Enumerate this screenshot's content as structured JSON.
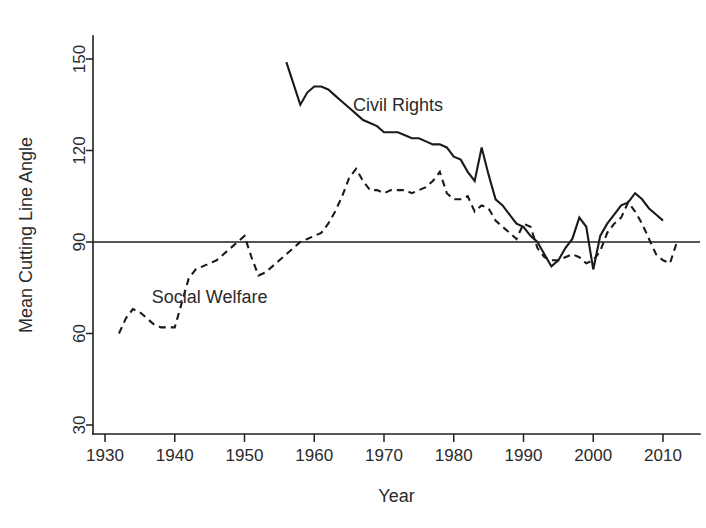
{
  "chart_data": {
    "type": "line",
    "title": "",
    "xlabel": "Year",
    "ylabel": "Mean Cutting Line Angle",
    "xlim": [
      1928,
      2014
    ],
    "ylim": [
      30,
      160
    ],
    "grid": false,
    "legend_position": "inline-annotation",
    "xticks": [
      1930,
      1940,
      1950,
      1960,
      1970,
      1980,
      1990,
      2000,
      2010
    ],
    "xtick_labels": [
      "1930",
      "1940",
      "1950",
      "1960",
      "1970",
      "1980",
      "1990",
      "2000",
      "2010"
    ],
    "yticks": [
      30,
      60,
      90,
      120,
      150
    ],
    "ytick_labels": [
      "30",
      "60",
      "90",
      "120",
      "150"
    ],
    "reference_line": {
      "value": 90,
      "label": "90",
      "style": "solid"
    },
    "series": [
      {
        "name": "Civil Rights",
        "style": "solid",
        "label_x": 1972,
        "label_y": 133,
        "x": [
          1956,
          1957,
          1958,
          1959,
          1960,
          1961,
          1962,
          1963,
          1964,
          1965,
          1966,
          1967,
          1968,
          1969,
          1970,
          1971,
          1972,
          1973,
          1974,
          1975,
          1976,
          1977,
          1978,
          1979,
          1980,
          1981,
          1982,
          1983,
          1984,
          1985,
          1986,
          1987,
          1988,
          1989,
          1990,
          1991,
          1992,
          1993,
          1994,
          1995,
          1996,
          1997,
          1998,
          1999,
          2000,
          2001,
          2002,
          2003,
          2004,
          2005,
          2006,
          2007,
          2008,
          2009,
          2010
        ],
        "y": [
          149,
          142,
          135,
          139,
          141,
          141,
          140,
          138,
          136,
          134,
          132,
          130,
          129,
          128,
          126,
          126,
          126,
          125,
          124,
          124,
          123,
          122,
          122,
          121,
          118,
          117,
          113,
          110,
          121,
          112,
          104,
          102,
          99,
          96,
          95,
          92,
          90,
          86,
          82,
          84,
          88,
          91,
          98,
          95,
          81,
          92,
          96,
          99,
          102,
          103,
          106,
          104,
          101,
          99,
          97
        ]
      },
      {
        "name": "Social Welfare",
        "style": "dashed",
        "label_x": 1945,
        "label_y": 70,
        "x": [
          1932,
          1933,
          1934,
          1935,
          1936,
          1937,
          1938,
          1939,
          1940,
          1941,
          1942,
          1943,
          1944,
          1945,
          1946,
          1947,
          1948,
          1949,
          1950,
          1951,
          1952,
          1953,
          1954,
          1955,
          1956,
          1957,
          1958,
          1959,
          1960,
          1961,
          1962,
          1963,
          1964,
          1965,
          1966,
          1967,
          1968,
          1969,
          1970,
          1971,
          1972,
          1973,
          1974,
          1975,
          1976,
          1977,
          1978,
          1979,
          1980,
          1981,
          1982,
          1983,
          1984,
          1985,
          1986,
          1987,
          1988,
          1989,
          1990,
          1991,
          1992,
          1993,
          1994,
          1995,
          1996,
          1997,
          1998,
          1999,
          2000,
          2001,
          2002,
          2003,
          2004,
          2005,
          2006,
          2007,
          2008,
          2009,
          2010,
          2011,
          2012
        ],
        "y": [
          60,
          65,
          68,
          67,
          65,
          63,
          62,
          62,
          62,
          70,
          78,
          81,
          82,
          83,
          84,
          86,
          88,
          90,
          92,
          85,
          79,
          80,
          82,
          84,
          86,
          88,
          90,
          91,
          92,
          93,
          96,
          100,
          105,
          111,
          114,
          110,
          107,
          107,
          106,
          107,
          107,
          107,
          106,
          107,
          108,
          110,
          113,
          106,
          104,
          104,
          105,
          100,
          102,
          101,
          97,
          95,
          93,
          91,
          96,
          95,
          88,
          85,
          84,
          84,
          85,
          86,
          85,
          83,
          84,
          87,
          93,
          96,
          98,
          103,
          100,
          96,
          91,
          86,
          84,
          83,
          90
        ]
      }
    ]
  }
}
